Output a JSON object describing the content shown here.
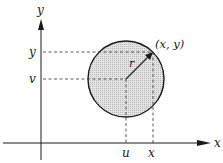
{
  "diagram": {
    "type": "coordinate-circle",
    "axes": {
      "x_label": "x",
      "y_label": "y"
    },
    "circle": {
      "center_label_x": "u",
      "center_label_y": "v",
      "radius_label": "r",
      "fill": "#d4d4d4",
      "stroke": "#1a1a1a"
    },
    "point": {
      "label": "(x, y)",
      "tick_x": "x",
      "tick_y": "y"
    }
  }
}
